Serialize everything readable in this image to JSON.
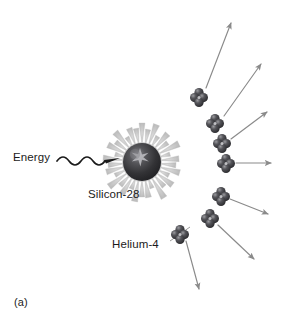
{
  "figure": {
    "panel_label": "(a)",
    "background_color": "#ffffff",
    "width": 282,
    "height": 318,
    "caption_position": "bottom-left"
  },
  "labels": {
    "energy": "Energy",
    "silicon": "Silicon-28",
    "helium": "Helium-4"
  },
  "colors": {
    "nucleus_dark": "#2a2a2c",
    "nucleus_mid": "#4a4a4e",
    "nucleus_highlight": "#8d8d92",
    "starburst": "#c9c9c9",
    "starburst_edge": "#b0b0b0",
    "particle_dark": "#303033",
    "particle_mid": "#4e4e52",
    "particle_highlight": "#9a9a9e",
    "arrow": "#8a8a8a",
    "energy_arrow": "#1b1b1b",
    "text": "#1b1b1b",
    "leader_line": "#9a9a9a"
  },
  "nucleus": {
    "name": "Silicon-28",
    "center_x": 142,
    "center_y": 162,
    "radius": 20,
    "spike_count": 34,
    "spike_outer_radius": 40
  },
  "energy_input": {
    "label": "Energy",
    "wave_start_x": 57,
    "wave_end_x": 112,
    "y": 160,
    "arrowhead_x": 118,
    "style": "wavy-arrow"
  },
  "helium_particles": [
    {
      "id": 1,
      "x": 199,
      "y": 97,
      "arrow_to_x": 232,
      "arrow_to_y": 22
    },
    {
      "id": 2,
      "x": 215,
      "y": 123,
      "arrow_to_x": 262,
      "arrow_to_y": 63
    },
    {
      "id": 3,
      "x": 222,
      "y": 143,
      "arrow_to_x": 268,
      "arrow_to_y": 110
    },
    {
      "id": 4,
      "x": 226,
      "y": 163,
      "arrow_to_x": 272,
      "arrow_to_y": 163
    },
    {
      "id": 5,
      "x": 221,
      "y": 196,
      "arrow_to_x": 269,
      "arrow_to_y": 213
    },
    {
      "id": 6,
      "x": 210,
      "y": 218,
      "arrow_to_x": 255,
      "arrow_to_y": 260
    },
    {
      "id": 7,
      "x": 180,
      "y": 234,
      "arrow_to_x": 200,
      "arrow_to_y": 290
    }
  ],
  "helium_leader": {
    "from_x": 170,
    "from_y": 241,
    "to_x": 190,
    "to_y": 228
  },
  "particle_geometry": {
    "sphere_radius": 4.6,
    "offset": 4.4,
    "spheres_per_cluster": 4,
    "arrangement": "clover"
  }
}
